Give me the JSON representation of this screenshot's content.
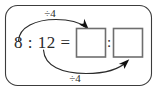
{
  "figure": {
    "kind": "ratio-simplification-diagram",
    "frame": {
      "shape": "rounded-rectangle",
      "stroke_color": "#3c3c3c",
      "background_color": "#ffffff"
    },
    "equation": {
      "left_term": "8",
      "ratio_separator": ":",
      "right_term": "12",
      "equals_sign": "=",
      "full_text": "8 : 12 ="
    },
    "answer": {
      "first_box_value": "",
      "separator": ":",
      "second_box_value": "",
      "box_stroke_color": "#6e6e6e"
    },
    "annotations": {
      "top_operation": "÷4",
      "bottom_operation": "÷4",
      "arrow_color": "#2b2b2b"
    }
  }
}
